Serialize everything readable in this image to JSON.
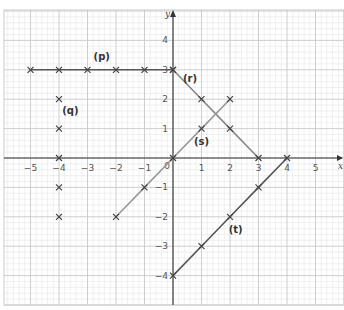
{
  "chart_data": {
    "type": "line",
    "title": "",
    "xlabel": "x",
    "ylabel": "y",
    "xlim": [
      -6,
      6
    ],
    "ylim": [
      -5,
      5
    ],
    "grid": true,
    "x_ticks": [
      -5,
      -4,
      -3,
      -2,
      -1,
      1,
      2,
      3,
      4,
      5
    ],
    "y_ticks": [
      -4,
      -3,
      -2,
      -1,
      1,
      2,
      3,
      4
    ],
    "origin_label": "0",
    "series": [
      {
        "name": "(p)",
        "color": "#555555",
        "points": [
          [
            -5,
            3
          ],
          [
            -4,
            3
          ],
          [
            -3,
            3
          ],
          [
            -2,
            3
          ],
          [
            -1,
            3
          ],
          [
            0,
            3
          ]
        ],
        "connected": true,
        "label_pos": [
          -2.5,
          3.35
        ]
      },
      {
        "name": "(q)",
        "color": "#777777",
        "points": [
          [
            -4,
            2
          ],
          [
            -4,
            1
          ],
          [
            -4,
            0
          ],
          [
            -4,
            -1
          ],
          [
            -4,
            -2
          ]
        ],
        "connected": false,
        "label_pos": [
          -3.6,
          1.5
        ]
      },
      {
        "name": "(r)",
        "color": "#888888",
        "points": [
          [
            0,
            3
          ],
          [
            1,
            2
          ],
          [
            2,
            1
          ],
          [
            3,
            0
          ]
        ],
        "connected": true,
        "label_pos": [
          0.6,
          2.6
        ]
      },
      {
        "name": "(s)",
        "color": "#999999",
        "points": [
          [
            -2,
            -2
          ],
          [
            -1,
            -1
          ],
          [
            0,
            0
          ],
          [
            1,
            1
          ],
          [
            2,
            2
          ]
        ],
        "connected": true,
        "label_pos": [
          1.0,
          0.45
        ]
      },
      {
        "name": "(t)",
        "color": "#555555",
        "points": [
          [
            0,
            -4
          ],
          [
            1,
            -3
          ],
          [
            2,
            -2
          ],
          [
            3,
            -1
          ],
          [
            4,
            0
          ]
        ],
        "connected": true,
        "label_pos": [
          2.2,
          -2.55
        ]
      }
    ]
  }
}
